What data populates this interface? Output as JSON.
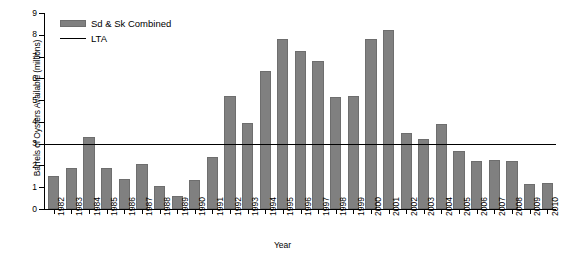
{
  "chart_data": {
    "type": "bar",
    "title": "",
    "xlabel": "Year",
    "ylabel": "Barrels of Oysters Available (millions)",
    "ylim": [
      0,
      9
    ],
    "ytick_step": 1,
    "grid": false,
    "legend_position": "top-left",
    "categories": [
      "1982",
      "1983",
      "1984",
      "1985",
      "1986",
      "1987",
      "1988",
      "1989",
      "1990",
      "1991",
      "1992",
      "1993",
      "1994",
      "1995",
      "1996",
      "1997",
      "1998",
      "1999",
      "2000",
      "2001",
      "2002",
      "2003",
      "2004",
      "2005",
      "2006",
      "2007",
      "2008",
      "2009",
      "2010"
    ],
    "yticks": [
      "0",
      "1",
      "2",
      "3",
      "4",
      "5",
      "6",
      "7",
      "8",
      "9"
    ],
    "series": [
      {
        "name": "Sd & Sk Combined",
        "type": "bar",
        "color": "#808080",
        "values": [
          1.5,
          1.9,
          3.3,
          1.9,
          1.4,
          2.05,
          1.05,
          0.6,
          1.35,
          2.4,
          5.2,
          3.95,
          6.35,
          7.8,
          7.25,
          6.8,
          5.15,
          5.2,
          7.8,
          8.2,
          3.5,
          3.2,
          3.9,
          2.65,
          2.2,
          2.25,
          2.2,
          1.15,
          1.2
        ]
      },
      {
        "name": "LTA",
        "type": "hline",
        "color": "#000000",
        "value": 3.6
      }
    ],
    "annotations": []
  },
  "legend": {
    "items": [
      {
        "label": "Sd & Sk Combined",
        "marker": "bar-swatch"
      },
      {
        "label": "LTA",
        "marker": "line-swatch"
      }
    ]
  }
}
